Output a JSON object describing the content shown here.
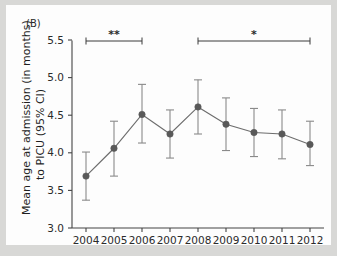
{
  "figure": {
    "panel_label": "(B)",
    "background_color": "#d8d8d6",
    "plot_background_color": "#fdfdfd"
  },
  "chart_data": {
    "type": "line",
    "title": "",
    "subtitle": "",
    "panel": "(B)",
    "xlabel": "",
    "ylabel": "Mean age at admission (in months) to PICU (95% CI)",
    "ylabel_line1": "Mean age at admission (in months)",
    "ylabel_line2": "to PICU (95% CI)",
    "categories": [
      "2004",
      "2005",
      "2006",
      "2007",
      "2008",
      "2009",
      "2010",
      "2011",
      "2012"
    ],
    "x": [
      2004,
      2005,
      2006,
      2007,
      2008,
      2009,
      2010,
      2011,
      2012
    ],
    "values": [
      3.69,
      4.06,
      4.51,
      4.25,
      4.61,
      4.38,
      4.27,
      4.25,
      4.11
    ],
    "ci_lower": [
      3.37,
      3.69,
      4.13,
      3.93,
      4.25,
      4.03,
      3.95,
      3.92,
      3.83
    ],
    "ci_upper": [
      4.01,
      4.42,
      4.91,
      4.57,
      4.97,
      4.73,
      4.59,
      4.57,
      4.42
    ],
    "ylim": [
      3.0,
      5.5
    ],
    "ytick_labels": [
      "3.0",
      "3.5",
      "4.0",
      "4.5",
      "5.0",
      "5.5"
    ],
    "yticks": [
      3.0,
      3.5,
      4.0,
      4.5,
      5.0,
      5.5
    ],
    "grid": false,
    "legend": "none",
    "marker": "filled-circle",
    "series_color": "#6d6d6d",
    "marker_color": "#595959",
    "errorbar_color": "#8a8a8a",
    "annotations": [
      {
        "name": "significance-bracket-1",
        "label": "**",
        "x_start": 2004,
        "x_end": 2006,
        "description": "significance bracket spanning 2004 to 2006, p-value marker two asterisks"
      },
      {
        "name": "significance-bracket-2",
        "label": "*",
        "x_start": 2008,
        "x_end": 2012,
        "description": "significance bracket spanning 2008 to 2012, p-value marker one asterisk"
      }
    ]
  }
}
